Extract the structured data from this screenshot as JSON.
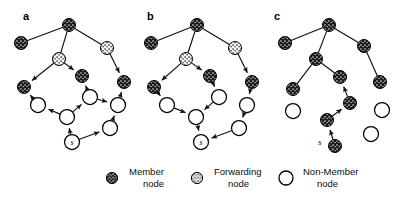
{
  "figure": {
    "type": "diagram",
    "background_color": "#ffffff",
    "line_color": "#111111"
  },
  "node_types": {
    "member": {
      "key": "member",
      "fill": "#1b1b1b",
      "stroke": "#000000",
      "speckle_color": "#ffffff",
      "legend_label_line1": "Member",
      "legend_label_line2": "node"
    },
    "forwarding": {
      "key": "forwarding",
      "fill": "#f2f2f2",
      "stroke": "#000000",
      "speckle_color": "#1b1b1b",
      "legend_label_line1": "Forwarding",
      "legend_label_line2": "node"
    },
    "nonmember": {
      "key": "nonmember",
      "fill": "#ffffff",
      "stroke": "#000000",
      "speckle_color": "none",
      "legend_label_line1": "Non-Member",
      "legend_label_line2": "node"
    }
  },
  "legend": {
    "items": [
      {
        "icon": "member-node-icon",
        "line1": "Member",
        "line2": "node"
      },
      {
        "icon": "forwarding-node-icon",
        "line1": "Forwarding",
        "line2": "node"
      },
      {
        "icon": "nonmember-node-icon",
        "line1": "Non-Member",
        "line2": "node"
      }
    ]
  },
  "panels": [
    {
      "id": "a",
      "letter": "a",
      "letter_pos": {
        "x": 23,
        "y": 20
      },
      "source_label": "s",
      "nodes": [
        {
          "id": "a-root",
          "x": 69,
          "y": 25,
          "type": "member",
          "r": 6.5
        },
        {
          "id": "a-m-l",
          "x": 21,
          "y": 43,
          "type": "member",
          "r": 6.5
        },
        {
          "id": "a-f-mid",
          "x": 59,
          "y": 59,
          "type": "forwarding",
          "r": 6.5
        },
        {
          "id": "a-f-r",
          "x": 107,
          "y": 48,
          "type": "forwarding",
          "r": 6.5
        },
        {
          "id": "a-m-c",
          "x": 82,
          "y": 76,
          "type": "member",
          "r": 6.5
        },
        {
          "id": "a-m-r",
          "x": 124,
          "y": 82,
          "type": "member",
          "r": 6.5
        },
        {
          "id": "a-m-bl",
          "x": 24,
          "y": 87,
          "type": "member",
          "r": 6.5
        },
        {
          "id": "a-n-l",
          "x": 38,
          "y": 105,
          "type": "nonmember",
          "r": 7.5
        },
        {
          "id": "a-n-c",
          "x": 67,
          "y": 117,
          "type": "nonmember",
          "r": 7.5
        },
        {
          "id": "a-n-u",
          "x": 90,
          "y": 97,
          "type": "nonmember",
          "r": 7.5
        },
        {
          "id": "a-n-r",
          "x": 118,
          "y": 105,
          "type": "nonmember",
          "r": 7.5
        },
        {
          "id": "a-n-br",
          "x": 110,
          "y": 128,
          "type": "nonmember",
          "r": 7.5
        },
        {
          "id": "a-s",
          "x": 72,
          "y": 142,
          "type": "nonmember",
          "r": 7.5,
          "label": "s",
          "label_inside": true
        }
      ],
      "edges": [
        {
          "from": "a-root",
          "to": "a-m-l",
          "arrow": "none"
        },
        {
          "from": "a-root",
          "to": "a-f-mid",
          "arrow": "none"
        },
        {
          "from": "a-root",
          "to": "a-f-r",
          "arrow": "none"
        },
        {
          "from": "a-f-mid",
          "to": "a-m-bl",
          "arrow": "head"
        },
        {
          "from": "a-f-mid",
          "to": "a-m-c",
          "arrow": "head"
        },
        {
          "from": "a-f-r",
          "to": "a-m-r",
          "arrow": "head"
        },
        {
          "from": "a-n-l",
          "to": "a-m-bl",
          "arrow": "head"
        },
        {
          "from": "a-n-c",
          "to": "a-n-l",
          "arrow": "head"
        },
        {
          "from": "a-n-c",
          "to": "a-n-u",
          "arrow": "head"
        },
        {
          "from": "a-n-u",
          "to": "a-m-c",
          "arrow": "head"
        },
        {
          "from": "a-n-u",
          "to": "a-n-r",
          "arrow": "head"
        },
        {
          "from": "a-n-r",
          "to": "a-m-r",
          "arrow": "head"
        },
        {
          "from": "a-n-br",
          "to": "a-n-r",
          "arrow": "head"
        },
        {
          "from": "a-s",
          "to": "a-n-c",
          "arrow": "head"
        },
        {
          "from": "a-s",
          "to": "a-n-br",
          "arrow": "head"
        }
      ]
    },
    {
      "id": "b",
      "letter": "b",
      "letter_pos": {
        "x": 147,
        "y": 20
      },
      "source_label": "s",
      "nodes": [
        {
          "id": "b-root",
          "x": 197,
          "y": 25,
          "type": "member",
          "r": 6.5
        },
        {
          "id": "b-m-l",
          "x": 151,
          "y": 43,
          "type": "member",
          "r": 6.5
        },
        {
          "id": "b-f-mid",
          "x": 186,
          "y": 59,
          "type": "forwarding",
          "r": 6.5
        },
        {
          "id": "b-f-r",
          "x": 235,
          "y": 48,
          "type": "forwarding",
          "r": 6.5
        },
        {
          "id": "b-m-c",
          "x": 210,
          "y": 76,
          "type": "member",
          "r": 6.5
        },
        {
          "id": "b-m-r",
          "x": 252,
          "y": 82,
          "type": "member",
          "r": 6.5
        },
        {
          "id": "b-m-bl",
          "x": 154,
          "y": 87,
          "type": "member",
          "r": 6.5
        },
        {
          "id": "b-n-l",
          "x": 167,
          "y": 105,
          "type": "nonmember",
          "r": 7.5
        },
        {
          "id": "b-n-c",
          "x": 196,
          "y": 117,
          "type": "nonmember",
          "r": 7.5
        },
        {
          "id": "b-n-u",
          "x": 219,
          "y": 97,
          "type": "nonmember",
          "r": 7.5
        },
        {
          "id": "b-n-r",
          "x": 247,
          "y": 105,
          "type": "nonmember",
          "r": 7.5
        },
        {
          "id": "b-n-br",
          "x": 239,
          "y": 128,
          "type": "nonmember",
          "r": 7.5
        },
        {
          "id": "b-s",
          "x": 201,
          "y": 142,
          "type": "nonmember",
          "r": 7.5,
          "label": "s",
          "label_inside": true
        }
      ],
      "edges": [
        {
          "from": "b-root",
          "to": "b-m-l",
          "arrow": "none"
        },
        {
          "from": "b-root",
          "to": "b-f-mid",
          "arrow": "none"
        },
        {
          "from": "b-root",
          "to": "b-f-r",
          "arrow": "none"
        },
        {
          "from": "b-f-mid",
          "to": "b-m-bl",
          "arrow": "head"
        },
        {
          "from": "b-f-mid",
          "to": "b-m-c",
          "arrow": "head"
        },
        {
          "from": "b-f-r",
          "to": "b-m-r",
          "arrow": "head"
        },
        {
          "from": "b-m-bl",
          "to": "b-n-l",
          "arrow": "head"
        },
        {
          "from": "b-n-l",
          "to": "b-n-c",
          "arrow": "head"
        },
        {
          "from": "b-m-c",
          "to": "b-n-u",
          "arrow": "head"
        },
        {
          "from": "b-n-u",
          "to": "b-n-c",
          "arrow": "head"
        },
        {
          "from": "b-m-r",
          "to": "b-n-r",
          "arrow": "head"
        },
        {
          "from": "b-n-r",
          "to": "b-n-br",
          "arrow": "head"
        },
        {
          "from": "b-n-c",
          "to": "b-s",
          "arrow": "head"
        },
        {
          "from": "b-n-br",
          "to": "b-s",
          "arrow": "head"
        }
      ]
    },
    {
      "id": "c",
      "letter": "c",
      "letter_pos": {
        "x": 274,
        "y": 20
      },
      "source_label": "s",
      "nodes": [
        {
          "id": "c-root",
          "x": 329,
          "y": 25,
          "type": "member",
          "r": 6.5
        },
        {
          "id": "c-m-l",
          "x": 285,
          "y": 43,
          "type": "member",
          "r": 6.5
        },
        {
          "id": "c-m-mid",
          "x": 316,
          "y": 59,
          "type": "member",
          "r": 6.5
        },
        {
          "id": "c-m-r",
          "x": 364,
          "y": 46,
          "type": "member",
          "r": 6.5
        },
        {
          "id": "c-m-c",
          "x": 340,
          "y": 77,
          "type": "member",
          "r": 6.5
        },
        {
          "id": "c-m-rr",
          "x": 380,
          "y": 82,
          "type": "member",
          "r": 6.5
        },
        {
          "id": "c-m-bl",
          "x": 293,
          "y": 89,
          "type": "member",
          "r": 6.5
        },
        {
          "id": "c-m-ch",
          "x": 350,
          "y": 103,
          "type": "member",
          "r": 6.5
        },
        {
          "id": "c-m-cl",
          "x": 327,
          "y": 120,
          "type": "member",
          "r": 6.5
        },
        {
          "id": "c-s",
          "x": 335,
          "y": 146,
          "type": "member",
          "r": 6.5,
          "label": "s",
          "label_inside": false,
          "label_pos": {
            "x": 320,
            "y": 145
          }
        },
        {
          "id": "c-n-1",
          "x": 293,
          "y": 111,
          "type": "nonmember",
          "r": 7.5
        },
        {
          "id": "c-n-2",
          "x": 382,
          "y": 110,
          "type": "nonmember",
          "r": 7.5
        },
        {
          "id": "c-n-3",
          "x": 371,
          "y": 134,
          "type": "nonmember",
          "r": 7.5
        }
      ],
      "edges": [
        {
          "from": "c-root",
          "to": "c-m-l",
          "arrow": "none"
        },
        {
          "from": "c-root",
          "to": "c-m-mid",
          "arrow": "none"
        },
        {
          "from": "c-root",
          "to": "c-m-r",
          "arrow": "none"
        },
        {
          "from": "c-m-mid",
          "to": "c-m-bl",
          "arrow": "none"
        },
        {
          "from": "c-m-mid",
          "to": "c-m-c",
          "arrow": "none"
        },
        {
          "from": "c-m-r",
          "to": "c-m-rr",
          "arrow": "none"
        },
        {
          "from": "c-m-ch",
          "to": "c-m-c",
          "arrow": "head"
        },
        {
          "from": "c-m-cl",
          "to": "c-m-ch",
          "arrow": "head"
        },
        {
          "from": "c-s",
          "to": "c-m-cl",
          "arrow": "head"
        }
      ]
    }
  ]
}
